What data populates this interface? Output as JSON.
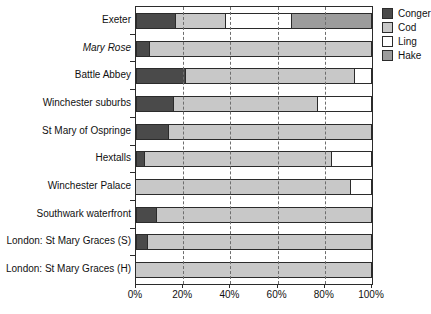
{
  "chart_data": {
    "type": "bar",
    "orientation": "horizontal",
    "stacked": true,
    "title": "",
    "xlabel": "",
    "ylabel": "",
    "xlim": [
      0,
      100
    ],
    "grid": "vertical-dashed",
    "gridlines_percent": [
      20,
      40,
      60,
      80
    ],
    "x_ticks_percent": [
      0,
      20,
      40,
      60,
      80,
      100
    ],
    "x_tick_labels": [
      "0%",
      "20%",
      "40%",
      "60%",
      "80%",
      "100%"
    ],
    "legend_position": "top-right-outside",
    "categories": [
      {
        "label": "Exeter",
        "italic": false
      },
      {
        "label": "Mary Rose",
        "italic": true
      },
      {
        "label": "Battle Abbey",
        "italic": false
      },
      {
        "label": "Winchester suburbs",
        "italic": false
      },
      {
        "label": "St Mary of Ospringe",
        "italic": false
      },
      {
        "label": "Hextalls",
        "italic": false
      },
      {
        "label": "Winchester Palace",
        "italic": false
      },
      {
        "label": "Southwark waterfront",
        "italic": false
      },
      {
        "label": "London: St Mary Graces (S)",
        "italic": false
      },
      {
        "label": "London: St Mary Graces (H)",
        "italic": false
      }
    ],
    "series": [
      {
        "name": "Conger",
        "color": "#4a4a4a",
        "values": [
          17,
          6,
          21,
          16,
          14,
          4,
          0,
          9,
          5,
          0
        ]
      },
      {
        "name": "Cod",
        "color": "#c8c8c8",
        "values": [
          21,
          94,
          72,
          61,
          86,
          79,
          91,
          91,
          95,
          100
        ]
      },
      {
        "name": "Ling",
        "color": "#ffffff",
        "values": [
          28,
          0,
          7,
          23,
          0,
          17,
          9,
          0,
          0,
          0
        ]
      },
      {
        "name": "Hake",
        "color": "#9c9c9c",
        "values": [
          34,
          0,
          0,
          0,
          0,
          0,
          0,
          0,
          0,
          0
        ]
      }
    ],
    "colors": {
      "bar_border": "#2b2b2b",
      "frame": "#2b2b2b",
      "gridline": "#6e6e6e",
      "background": "#ffffff"
    }
  }
}
